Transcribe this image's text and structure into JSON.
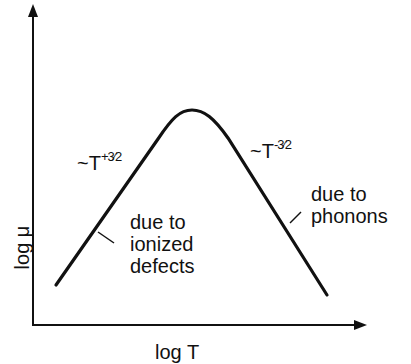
{
  "diagram": {
    "title": "",
    "x_axis_label": "log T",
    "y_axis_label": "log μ",
    "curve_description": "Mobility vs temperature: rising branch, rounded peak, falling branch",
    "left_branch": {
      "power_law_prefix": "~T",
      "power_law_exponent": "+3⁄2",
      "annotation": [
        "due to",
        "ionized",
        "defects"
      ]
    },
    "right_branch": {
      "power_law_prefix": "~T",
      "power_law_exponent": "-3⁄2",
      "annotation": [
        "due to",
        "phonons"
      ]
    },
    "colors": {
      "line": "#111111",
      "background": "#ffffff"
    }
  }
}
